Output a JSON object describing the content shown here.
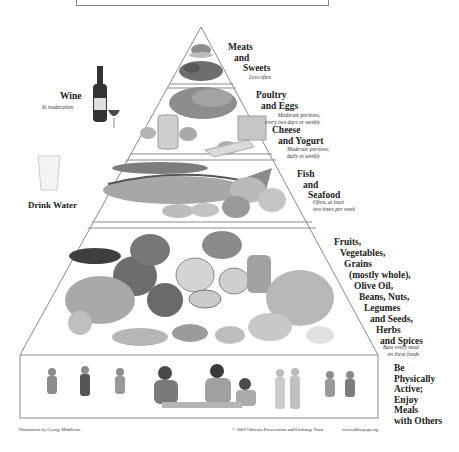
{
  "pyramid": {
    "tiers": [
      {
        "id": "meats-sweets",
        "lines": [
          "Meats",
          "and",
          "Sweets"
        ],
        "note": [
          "Less often"
        ]
      },
      {
        "id": "poultry-eggs",
        "lines": [
          "Poultry",
          "and Eggs"
        ],
        "note": [
          "Moderate portions,",
          "every two days or weekly"
        ]
      },
      {
        "id": "cheese-yogurt",
        "lines": [
          "Cheese",
          "and Yogurt"
        ],
        "note": [
          "Moderate portions,",
          "daily to weekly"
        ]
      },
      {
        "id": "fish-seafood",
        "lines": [
          "Fish",
          "and",
          "Seafood"
        ],
        "note": [
          "Often, at least",
          "two times per week"
        ]
      },
      {
        "id": "plant-foods",
        "lines": [
          "Fruits,",
          "Vegetables,",
          "Grains",
          "(mostly whole),",
          "Olive Oil,",
          "Beans, Nuts,",
          "Legumes",
          "and Seeds,",
          "Herbs",
          "and Spices"
        ],
        "note": [
          "Base every meal",
          "on these foods"
        ]
      },
      {
        "id": "activity",
        "lines": [
          "Be",
          "Physically",
          "Active;",
          "Enjoy",
          "Meals",
          "with Others"
        ]
      }
    ],
    "side": {
      "wine": {
        "label": "Wine",
        "note": "In moderation"
      },
      "water": {
        "label": "Drink Water"
      }
    }
  },
  "footer": {
    "credit": "Illustrations by George Middleton",
    "copyright": "© 2009 Oldways Preservation and Exchange Trust",
    "url": "www.oldwayspt.org"
  },
  "colors": {
    "line": "#8a8a8a",
    "text": "#222222",
    "illustration": "#7a7a7a"
  }
}
